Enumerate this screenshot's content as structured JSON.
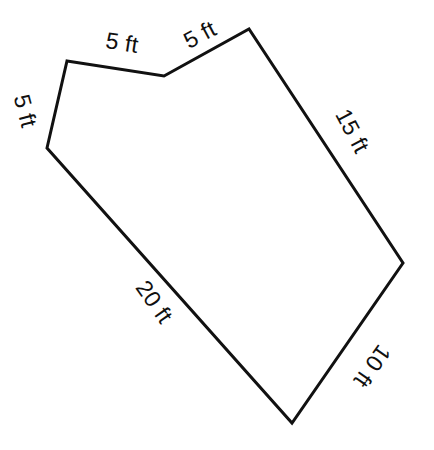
{
  "figure": {
    "kind": "geometry-diagram",
    "shape_name": "irregular-heptagon",
    "units": "ft",
    "canvas": {
      "width": 434,
      "height": 450
    },
    "style": {
      "background_color": "#ffffff",
      "stroke_color": "#111111",
      "stroke_width": 3,
      "fill_color": "none",
      "label_color": "#101010",
      "label_font_size": 23
    },
    "vertices": [
      {
        "id": "A",
        "x": 67,
        "y": 61
      },
      {
        "id": "B",
        "x": 164,
        "y": 76
      },
      {
        "id": "C",
        "x": 249,
        "y": 29
      },
      {
        "id": "D",
        "x": 403,
        "y": 263
      },
      {
        "id": "E",
        "x": 292,
        "y": 423
      },
      {
        "id": "F",
        "x": 47,
        "y": 148
      }
    ],
    "polygon_points": "67,61 164,76 249,29 403,263 292,423 47,148",
    "edges": [
      {
        "id": "edge-top-left",
        "from": "A",
        "to": "B",
        "label": "5 ft",
        "value": 5,
        "label_x": 122,
        "label_y": 43,
        "label_rotation": 9
      },
      {
        "id": "edge-top-right",
        "from": "B",
        "to": "C",
        "label": "5 ft",
        "value": 5,
        "label_x": 200,
        "label_y": 35,
        "label_rotation": -28
      },
      {
        "id": "edge-right-upper",
        "from": "C",
        "to": "D",
        "label": "15 ft",
        "value": 15,
        "label_x": 352,
        "label_y": 131,
        "label_rotation": 62
      },
      {
        "id": "edge-right-lower",
        "from": "D",
        "to": "E",
        "label": "10 ft",
        "value": 10,
        "label_x": 372,
        "label_y": 366,
        "label_rotation": 125
      },
      {
        "id": "edge-bottom-left",
        "from": "E",
        "to": "F",
        "label": "20 ft",
        "value": 20,
        "label_x": 154,
        "label_y": 302,
        "label_rotation": 55
      },
      {
        "id": "edge-left",
        "from": "F",
        "to": "A",
        "label": "5 ft",
        "value": 5,
        "label_x": 25,
        "label_y": 111,
        "label_rotation": 75
      }
    ]
  }
}
